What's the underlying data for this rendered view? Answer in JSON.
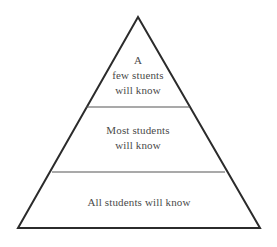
{
  "diagram": {
    "type": "pyramid",
    "background_color": "#ffffff",
    "outline_color": "#2b2b2b",
    "divider_color": "#555555",
    "text_color": "#4a4a4a",
    "geometry": {
      "apex": [
        138,
        17
      ],
      "base_left": [
        18,
        228
      ],
      "base_right": [
        260,
        228
      ],
      "divider_1_y": 107,
      "divider_2_y": 172
    },
    "tiers": [
      {
        "id": "top",
        "name": "a-few-students-tier",
        "lines": [
          "A",
          "few stuents",
          "will know"
        ]
      },
      {
        "id": "middle",
        "name": "most-students-tier",
        "lines": [
          "Most students",
          "will know"
        ]
      },
      {
        "id": "bottom",
        "name": "all-students-tier",
        "lines": [
          "All students will know"
        ]
      }
    ]
  }
}
